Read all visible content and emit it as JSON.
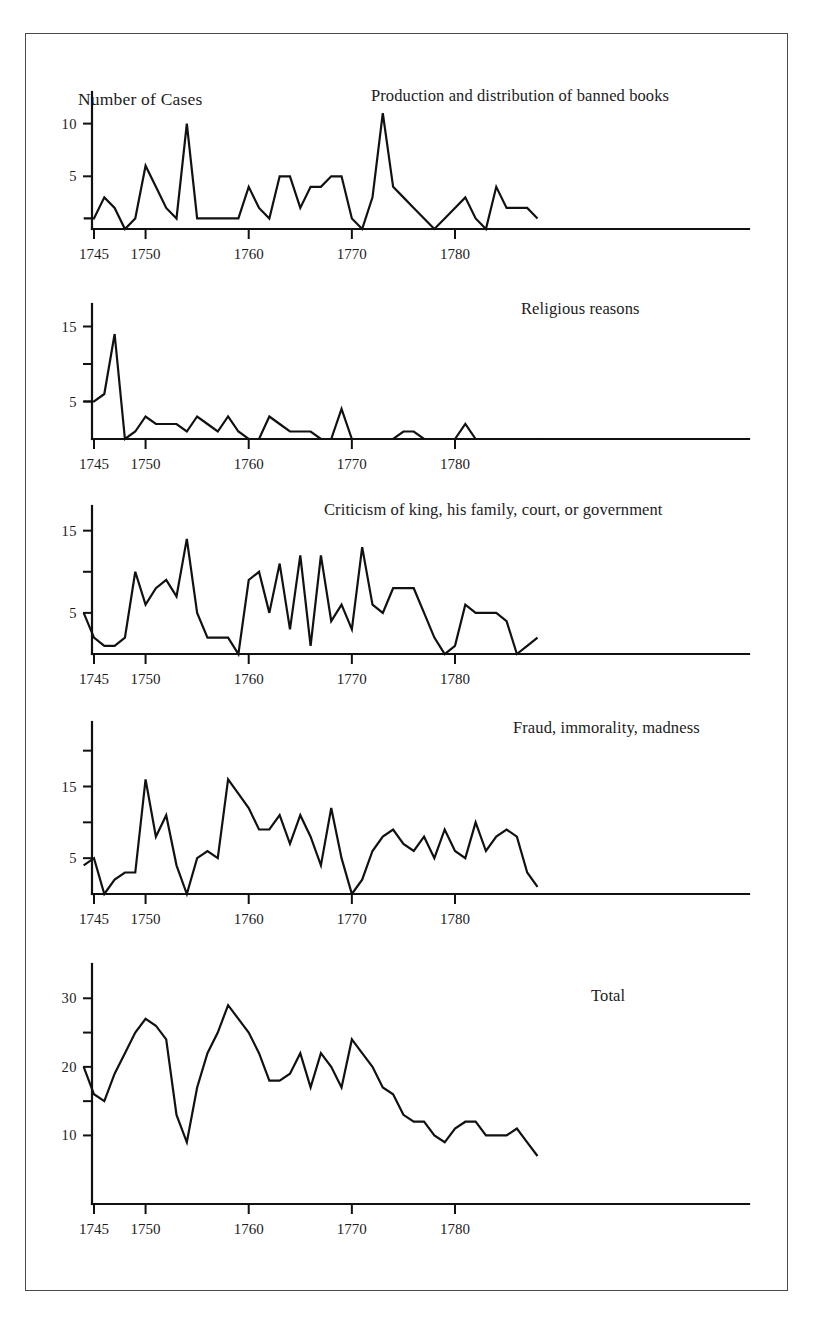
{
  "figure": {
    "top_bleed_text": "",
    "y_axis_label": "Number of Cases"
  },
  "chart_data": [
    {
      "type": "line",
      "title": "Production and distribution of banned books",
      "xlabel": "",
      "ylabel": "Number of Cases",
      "xlim": [
        1744,
        1789
      ],
      "ylim": [
        0,
        13
      ],
      "grid": false,
      "legend": "none",
      "yticks": [
        5,
        10
      ],
      "ytick_labels": [
        "5",
        "10"
      ],
      "xticks": [
        1745,
        1750,
        1760,
        1770,
        1780
      ],
      "xtick_labels": [
        "1745",
        "1750",
        "1760",
        "1770",
        "1780"
      ],
      "x": [
        1744,
        1745,
        1746,
        1747,
        1748,
        1749,
        1750,
        1751,
        1752,
        1753,
        1754,
        1755,
        1756,
        1757,
        1758,
        1759,
        1760,
        1761,
        1762,
        1763,
        1764,
        1765,
        1766,
        1767,
        1768,
        1769,
        1770,
        1771,
        1772,
        1773,
        1774,
        1775,
        1776,
        1777,
        1778,
        1779,
        1780,
        1781,
        1782,
        1783,
        1784,
        1785,
        1786,
        1787,
        1788
      ],
      "values": [
        1,
        1,
        3,
        2,
        0,
        1,
        6,
        4,
        2,
        1,
        10,
        1,
        1,
        1,
        1,
        1,
        4,
        2,
        1,
        5,
        5,
        2,
        4,
        4,
        5,
        5,
        1,
        0,
        3,
        11,
        4,
        3,
        2,
        1,
        0,
        1,
        2,
        3,
        1,
        0,
        4,
        2,
        2,
        2,
        1
      ]
    },
    {
      "type": "line",
      "title": "Religious reasons",
      "xlabel": "",
      "ylabel": "",
      "xlim": [
        1744,
        1789
      ],
      "ylim": [
        0,
        18
      ],
      "grid": false,
      "legend": "none",
      "yticks": [
        5,
        10,
        15
      ],
      "ytick_labels": [
        "5",
        "",
        "15"
      ],
      "xticks": [
        1745,
        1750,
        1760,
        1770,
        1780
      ],
      "xtick_labels": [
        "1745",
        "1750",
        "1760",
        "1770",
        "1780"
      ],
      "x": [
        1744,
        1745,
        1746,
        1747,
        1748,
        1749,
        1750,
        1751,
        1752,
        1753,
        1754,
        1755,
        1756,
        1757,
        1758,
        1759,
        1760,
        1761,
        1762,
        1763,
        1764,
        1765,
        1766,
        1767,
        1768,
        1769,
        1770,
        1771,
        1772,
        1773,
        1774,
        1775,
        1776,
        1777,
        1778,
        1779,
        1780,
        1781,
        1782,
        1783,
        1784,
        1785,
        1786,
        1787,
        1788
      ],
      "values": [
        5,
        5,
        6,
        14,
        0,
        1,
        3,
        2,
        2,
        2,
        1,
        3,
        2,
        1,
        3,
        1,
        0,
        0,
        3,
        2,
        1,
        1,
        1,
        0,
        0,
        4,
        0,
        0,
        0,
        0,
        0,
        1,
        1,
        0,
        0,
        0,
        0,
        2,
        0,
        0,
        0,
        0,
        0,
        0,
        0
      ]
    },
    {
      "type": "line",
      "title": "Criticism of king, his family, court, or government",
      "xlabel": "",
      "ylabel": "",
      "xlim": [
        1744,
        1789
      ],
      "ylim": [
        0,
        18
      ],
      "grid": false,
      "legend": "none",
      "yticks": [
        5,
        10,
        15
      ],
      "ytick_labels": [
        "5",
        "",
        "15"
      ],
      "xticks": [
        1745,
        1750,
        1760,
        1770,
        1780
      ],
      "xtick_labels": [
        "1745",
        "1750",
        "1760",
        "1770",
        "1780"
      ],
      "x": [
        1744,
        1745,
        1746,
        1747,
        1748,
        1749,
        1750,
        1751,
        1752,
        1753,
        1754,
        1755,
        1756,
        1757,
        1758,
        1759,
        1760,
        1761,
        1762,
        1763,
        1764,
        1765,
        1766,
        1767,
        1768,
        1769,
        1770,
        1771,
        1772,
        1773,
        1774,
        1775,
        1776,
        1777,
        1778,
        1779,
        1780,
        1781,
        1782,
        1783,
        1784,
        1785,
        1786,
        1787,
        1788
      ],
      "values": [
        5,
        2,
        1,
        1,
        2,
        10,
        6,
        8,
        9,
        7,
        14,
        5,
        2,
        2,
        2,
        0,
        9,
        10,
        5,
        11,
        3,
        12,
        1,
        12,
        4,
        6,
        3,
        13,
        6,
        5,
        8,
        8,
        8,
        5,
        2,
        0,
        1,
        6,
        5,
        5,
        5,
        4,
        0,
        1,
        2,
        6
      ]
    },
    {
      "type": "line",
      "title": "Fraud, immorality, madness",
      "xlabel": "",
      "ylabel": "",
      "xlim": [
        1744,
        1789
      ],
      "ylim": [
        0,
        24
      ],
      "grid": false,
      "legend": "none",
      "yticks": [
        5,
        10,
        15,
        20
      ],
      "ytick_labels": [
        "5",
        "",
        "15",
        ""
      ],
      "xticks": [
        1745,
        1750,
        1760,
        1770,
        1780
      ],
      "xtick_labels": [
        "1745",
        "1750",
        "1760",
        "1770",
        "1780"
      ],
      "x": [
        1744,
        1745,
        1746,
        1747,
        1748,
        1749,
        1750,
        1751,
        1752,
        1753,
        1754,
        1755,
        1756,
        1757,
        1758,
        1759,
        1760,
        1761,
        1762,
        1763,
        1764,
        1765,
        1766,
        1767,
        1768,
        1769,
        1770,
        1771,
        1772,
        1773,
        1774,
        1775,
        1776,
        1777,
        1778,
        1779,
        1780,
        1781,
        1782,
        1783,
        1784,
        1785,
        1786,
        1787,
        1788
      ],
      "values": [
        4,
        5,
        0,
        2,
        3,
        3,
        16,
        8,
        11,
        4,
        0,
        5,
        6,
        5,
        16,
        14,
        12,
        9,
        9,
        11,
        7,
        11,
        8,
        4,
        12,
        5,
        0,
        2,
        6,
        8,
        9,
        7,
        6,
        8,
        5,
        9,
        6,
        5,
        10,
        6,
        8,
        9,
        8,
        3,
        1
      ]
    },
    {
      "type": "line",
      "title": "Total",
      "xlabel": "",
      "ylabel": "",
      "xlim": [
        1744,
        1789
      ],
      "ylim": [
        0,
        35
      ],
      "grid": false,
      "legend": "none",
      "yticks": [
        10,
        15,
        20,
        25,
        30
      ],
      "ytick_labels": [
        "10",
        "",
        "20",
        "",
        "30"
      ],
      "xticks": [
        1745,
        1750,
        1760,
        1770,
        1780
      ],
      "xtick_labels": [
        "1745",
        "1750",
        "1760",
        "1770",
        "1780"
      ],
      "x": [
        1744,
        1745,
        1746,
        1747,
        1748,
        1749,
        1750,
        1751,
        1752,
        1753,
        1754,
        1755,
        1756,
        1757,
        1758,
        1759,
        1760,
        1761,
        1762,
        1763,
        1764,
        1765,
        1766,
        1767,
        1768,
        1769,
        1770,
        1771,
        1772,
        1773,
        1774,
        1775,
        1776,
        1777,
        1778,
        1779,
        1780,
        1781,
        1782,
        1783,
        1784,
        1785,
        1786,
        1787,
        1788
      ],
      "values": [
        20,
        16,
        15,
        19,
        22,
        25,
        27,
        26,
        24,
        13,
        9,
        17,
        22,
        25,
        29,
        27,
        25,
        22,
        18,
        18,
        19,
        22,
        17,
        22,
        20,
        17,
        24,
        22,
        20,
        17,
        16,
        13,
        12,
        12,
        10,
        9,
        11,
        12,
        12,
        10,
        10,
        10,
        11,
        9,
        7
      ]
    }
  ]
}
